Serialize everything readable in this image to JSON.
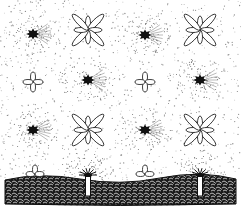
{
  "illustration": {
    "description": "Black-and-white stippled pattern of spiky blobs, outlined petal flowers, and a textured ground band with posts",
    "colors": {
      "ink": "#111111",
      "background": "#ffffff",
      "stipple": "#8a8a8a"
    },
    "width": 241,
    "height": 212,
    "motifs": [
      {
        "type": "blob",
        "x": 33,
        "y": 34
      },
      {
        "type": "big-flower",
        "x": 88,
        "y": 30
      },
      {
        "type": "blob",
        "x": 145,
        "y": 35
      },
      {
        "type": "big-flower",
        "x": 200,
        "y": 30
      },
      {
        "type": "small-cross",
        "x": 33,
        "y": 82
      },
      {
        "type": "blob",
        "x": 88,
        "y": 80
      },
      {
        "type": "small-cross",
        "x": 145,
        "y": 82
      },
      {
        "type": "blob",
        "x": 200,
        "y": 80
      },
      {
        "type": "blob",
        "x": 33,
        "y": 130
      },
      {
        "type": "big-flower",
        "x": 88,
        "y": 130
      },
      {
        "type": "blob",
        "x": 145,
        "y": 130
      },
      {
        "type": "big-flower",
        "x": 200,
        "y": 130
      },
      {
        "type": "ground-flower",
        "x": 35,
        "y": 170
      },
      {
        "type": "post",
        "x": 88,
        "y": 180
      },
      {
        "type": "ground-flower",
        "x": 145,
        "y": 170
      },
      {
        "type": "post",
        "x": 200,
        "y": 180
      }
    ],
    "ground": {
      "top": 178,
      "bottom": 204
    }
  }
}
